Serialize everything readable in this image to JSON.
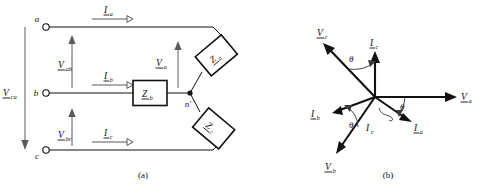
{
  "figure": {
    "title_a": "(a)",
    "title_b": "(b)",
    "caption_a_name": "circuit-diagram",
    "caption_b_name": "phasor-diagram"
  },
  "circuit": {
    "terminals": [
      {
        "id": "a",
        "label": "a"
      },
      {
        "id": "b",
        "label": "b"
      },
      {
        "id": "c",
        "label": "c"
      }
    ],
    "neutral_node": "n'",
    "currents": [
      {
        "id": "Ia",
        "symbol": "I",
        "subscript": "a"
      },
      {
        "id": "Ib",
        "symbol": "I",
        "subscript": "b"
      },
      {
        "id": "Ic",
        "symbol": "I",
        "subscript": "c"
      }
    ],
    "voltages": [
      {
        "id": "Vab",
        "symbol": "V",
        "subscript": "ab"
      },
      {
        "id": "Vbc",
        "symbol": "V",
        "subscript": "bc"
      },
      {
        "id": "Vca",
        "symbol": "V",
        "subscript": "ca"
      },
      {
        "id": "Va",
        "symbol": "V",
        "subscript": "a"
      }
    ],
    "impedances": [
      {
        "id": "Za",
        "symbol": "Z",
        "subscript": "a",
        "shape": "rotated-box"
      },
      {
        "id": "Zb",
        "symbol": "Z",
        "subscript": "b",
        "shape": "upright-box"
      },
      {
        "id": "Zc",
        "symbol": "Z",
        "subscript": "c",
        "shape": "rotated-box"
      }
    ]
  },
  "phasors": {
    "angle_label": "θ",
    "vectors": [
      {
        "id": "Va",
        "symbol": "V",
        "subscript": "a",
        "angle_deg": 0,
        "underlined": true
      },
      {
        "id": "Vb",
        "symbol": "V",
        "subscript": "b",
        "angle_deg": 240,
        "underlined": true
      },
      {
        "id": "Vc",
        "symbol": "V",
        "subscript": "c",
        "angle_deg": 120,
        "underlined": true
      },
      {
        "id": "Ia",
        "symbol": "I",
        "subscript": "a",
        "angle_deg": -30,
        "underlined": true
      },
      {
        "id": "Ib",
        "symbol": "I",
        "subscript": "b",
        "angle_deg": 210,
        "underlined": true
      },
      {
        "id": "Ic",
        "symbol": "I",
        "subscript": "c",
        "angle_deg": 90,
        "underlined": true
      },
      {
        "id": "Ic_leader",
        "symbol": "I",
        "subscript": "c",
        "angle_deg": null,
        "underlined": false
      }
    ],
    "angle_markers": [
      {
        "between": "Va-Ia",
        "label": "θ"
      },
      {
        "between": "Vb-Ib",
        "label": "θ"
      },
      {
        "between": "Vc-Ic",
        "label": "θ"
      }
    ]
  },
  "colors": {
    "ink": "#111111",
    "thin": "#5a5a5a",
    "paper": "#ffffff"
  }
}
